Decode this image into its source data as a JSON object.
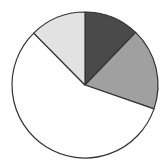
{
  "chart_data": {
    "type": "pie",
    "title": "",
    "categories": [
      "Slice A",
      "Slice B",
      "Slice C",
      "Slice D"
    ],
    "values": [
      12.2,
      18.1,
      57.3,
      12.4
    ],
    "colors": [
      "#4a4a4a",
      "#a0a0a0",
      "#ffffff",
      "#e2e2e2"
    ],
    "start_angle_deg": 0,
    "direction": "clockwise",
    "legend": "none",
    "labels_shown": false,
    "stroke_color": "#333333"
  },
  "layout": {
    "cx": 85,
    "cy": 85,
    "r": 73
  }
}
